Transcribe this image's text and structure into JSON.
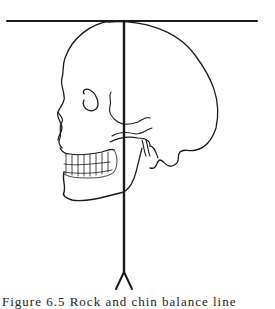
{
  "figure": {
    "line_color": "#1a1a1a",
    "background": "#ffffff",
    "caption": "Figure 6.5 Rock and chin balance line"
  }
}
